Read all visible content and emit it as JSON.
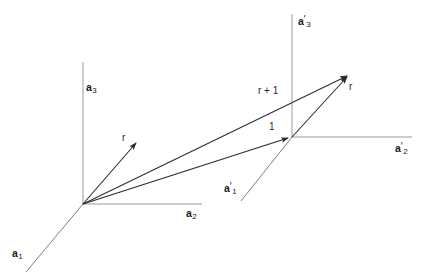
{
  "figure": {
    "background_color": "#ffffff",
    "axis_color": "#9a9a9a",
    "vector_color": "#2b2b2b",
    "text_color": "#1a1a1a",
    "width": 426,
    "height": 278
  },
  "frames": [
    {
      "name": "unprimed-frame",
      "origin": {
        "x": 83,
        "y": 204
      },
      "axes": [
        {
          "id": "a1",
          "base": "a",
          "prime": "",
          "subscript": "1",
          "label_x": 12,
          "label_y": 247,
          "end": {
            "x": 26,
            "y": 272
          },
          "kind": "axis-line"
        },
        {
          "id": "a2",
          "base": "a",
          "prime": "",
          "subscript": "2",
          "label_x": 186,
          "label_y": 207,
          "end": {
            "x": 202,
            "y": 204
          },
          "kind": "axis-line"
        },
        {
          "id": "a3",
          "base": "a",
          "prime": "",
          "subscript": "3",
          "label_x": 86,
          "label_y": 81,
          "end": {
            "x": 83,
            "y": 62
          },
          "kind": "axis-line"
        }
      ]
    },
    {
      "name": "primed-frame",
      "origin": {
        "x": 292,
        "y": 137
      },
      "axes": [
        {
          "id": "a1p",
          "base": "a",
          "prime": "′",
          "subscript": "1",
          "label_x": 224,
          "label_y": 182,
          "end": {
            "x": 241,
            "y": 201
          },
          "kind": "axis-line"
        },
        {
          "id": "a2p",
          "base": "a",
          "prime": "′",
          "subscript": "2",
          "label_x": 395,
          "label_y": 142,
          "end": {
            "x": 412,
            "y": 137
          },
          "kind": "axis-line"
        },
        {
          "id": "a3p",
          "base": "a",
          "prime": "′",
          "subscript": "3",
          "label_x": 298,
          "label_y": 15,
          "end": {
            "x": 292,
            "y": 14
          },
          "kind": "axis-line"
        }
      ]
    }
  ],
  "vectors": [
    {
      "id": "r-small",
      "label": "r",
      "from": {
        "x": 83,
        "y": 204
      },
      "to": {
        "x": 139,
        "y": 140
      },
      "label_x": 122,
      "label_y": 133,
      "arrow": true
    },
    {
      "id": "one",
      "label": "1",
      "from": {
        "x": 83,
        "y": 204
      },
      "to": {
        "x": 292,
        "y": 137
      },
      "label_x": 269,
      "label_y": 122,
      "arrow": true
    },
    {
      "id": "r-plus-one",
      "label": "r + 1",
      "from": {
        "x": 83,
        "y": 204
      },
      "to": {
        "x": 351,
        "y": 73
      },
      "label_x": 258,
      "label_y": 86,
      "arrow": true
    },
    {
      "id": "r-primed",
      "label": "r",
      "from": {
        "x": 292,
        "y": 137
      },
      "to": {
        "x": 351,
        "y": 73
      },
      "label_x": 349,
      "label_y": 82,
      "arrow": true
    }
  ]
}
